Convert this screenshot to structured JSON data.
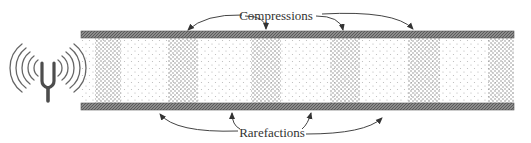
{
  "diagram": {
    "source": {
      "name": "tuning-fork",
      "position": [
        48,
        72
      ]
    },
    "tube": {
      "x_start": 81,
      "x_end": 514,
      "top_wall": [
        31,
        38
      ],
      "bottom_wall": [
        103,
        110
      ]
    },
    "compression_bands": [
      {
        "x0": 95,
        "x1": 121
      },
      {
        "x0": 168,
        "x1": 198
      },
      {
        "x0": 251,
        "x1": 281
      },
      {
        "x0": 330,
        "x1": 360
      },
      {
        "x0": 408,
        "x1": 440
      },
      {
        "x0": 488,
        "x1": 514
      }
    ],
    "labels": {
      "compressions": "Compressions",
      "rarefactions": "Rarefactions"
    },
    "compression_arrow_targets": [
      [
        188,
        30
      ],
      [
        266,
        30
      ],
      [
        343,
        30
      ],
      [
        413,
        30
      ]
    ],
    "rarefaction_arrow_targets": [
      [
        160,
        113
      ],
      [
        231,
        113
      ],
      [
        310,
        113
      ],
      [
        382,
        118
      ]
    ],
    "colors": {
      "wall": "#7a7a7a",
      "wall_dark": "#4a4a4a",
      "dense_dot": "#8a8a8a",
      "sparse_dot": "#b5b5b5",
      "fork": "#4d4d4d",
      "arrow": "#444444"
    }
  }
}
